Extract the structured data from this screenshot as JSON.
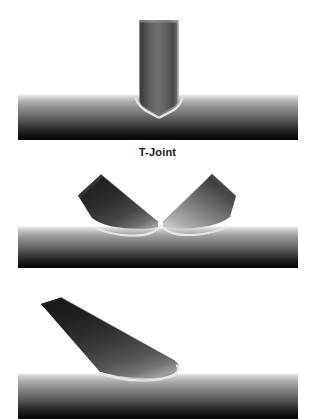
{
  "figure": {
    "background_color": "#ffffff",
    "width": 315,
    "height": 419
  },
  "panels": [
    {
      "id": "t-joint",
      "caption": "T-Joint",
      "description": "Vertical branch tube welded perpendicular onto a horizontal chord tube",
      "brace_count": 1,
      "brace_angle_degrees": 90,
      "chord": {
        "name": "chord-tube",
        "x_start": 18,
        "x_end": 298,
        "y_top": 94,
        "y_bottom": 140,
        "diameter_px": 46
      },
      "braces": [
        {
          "name": "vertical-brace",
          "x_left": 139,
          "x_right": 178,
          "y_top": 20,
          "diameter_px": 39,
          "angle_degrees": 90
        }
      ],
      "weld": {
        "name": "weld-bead",
        "color": "#f2f2f2"
      }
    },
    {
      "id": "k-joint",
      "caption": "K-Joint",
      "description": "Two inclined braces meeting at a common apex on the chord",
      "brace_count": 2,
      "brace_angle_degrees": 45,
      "chord": {
        "name": "chord-tube",
        "x_start": 18,
        "x_end": 298,
        "y_top": 226,
        "y_bottom": 268,
        "diameter_px": 42
      },
      "braces": [
        {
          "name": "left-brace",
          "angle_degrees": 135,
          "shade": "dark"
        },
        {
          "name": "right-brace",
          "angle_degrees": 45,
          "shade": "light"
        }
      ],
      "weld": {
        "name": "weld-bead",
        "color": "#f2f2f2"
      }
    },
    {
      "id": "y-joint",
      "caption": "",
      "description": "Single inclined brace welded at an acute angle onto the chord, image cropped at lower edge",
      "brace_count": 1,
      "brace_angle_degrees": 30,
      "chord": {
        "name": "chord-tube",
        "x_start": 18,
        "x_end": 298,
        "y_top": 373,
        "y_bottom": 419,
        "diameter_px": 46
      },
      "braces": [
        {
          "name": "inclined-brace",
          "angle_degrees": 30,
          "shade": "dark"
        }
      ],
      "weld": {
        "name": "weld-bead",
        "color": "#f2f2f2"
      }
    }
  ],
  "colors": {
    "pipe_highlight": "#e9e9e9",
    "pipe_midtone": "#8a8a8a",
    "pipe_shadow": "#0a0a0a",
    "weld_bead": "#f4f4f4",
    "caption_text": "#1a1a1a",
    "background": "#ffffff"
  }
}
